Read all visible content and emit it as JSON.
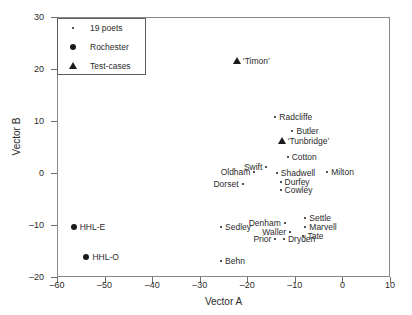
{
  "chart_data": {
    "type": "scatter",
    "title": "",
    "xlabel": "Vector A",
    "ylabel": "Vector B",
    "xlim": [
      -60,
      10
    ],
    "ylim": [
      -20,
      30
    ],
    "xticks": [
      -60,
      -50,
      -40,
      -30,
      -20,
      -10,
      0,
      10
    ],
    "xtick_labels": [
      "–60",
      "–50",
      "–40",
      "–30",
      "–20",
      "–10",
      "0",
      "10"
    ],
    "yticks": [
      -20,
      -10,
      0,
      10,
      20,
      30
    ],
    "ytick_labels": [
      "–20",
      "–10",
      "0",
      "10",
      "20",
      "30"
    ],
    "grid": false,
    "legend_position": "top-left",
    "legend": [
      {
        "label": "19 poets",
        "marker": "small-dot"
      },
      {
        "label": "Rochester",
        "marker": "filled-circle"
      },
      {
        "label": "Test-cases",
        "marker": "filled-triangle"
      }
    ],
    "series": [
      {
        "name": "19 poets",
        "marker": "small-dot",
        "points": [
          {
            "label": "Radcliffe",
            "x": -14.1,
            "y": 10.8,
            "label_side": "right"
          },
          {
            "label": "Butler",
            "x": -10.5,
            "y": 8.0,
            "label_side": "right"
          },
          {
            "label": "Cotton",
            "x": -11.5,
            "y": 3.1,
            "label_side": "right"
          },
          {
            "label": "Swift",
            "x": -16.0,
            "y": 1.2,
            "label_side": "left"
          },
          {
            "label": "Oldham",
            "x": -18.5,
            "y": 0.2,
            "label_side": "left"
          },
          {
            "label": "Shadwell",
            "x": -13.8,
            "y": 0.0,
            "label_side": "right"
          },
          {
            "label": "Milton",
            "x": -3.2,
            "y": 0.2,
            "label_side": "right"
          },
          {
            "label": "Durfey",
            "x": -13.0,
            "y": -1.7,
            "label_side": "right"
          },
          {
            "label": "Dorset",
            "x": -21.0,
            "y": -2.1,
            "label_side": "left"
          },
          {
            "label": "Cowley",
            "x": -13.0,
            "y": -3.3,
            "label_side": "right"
          },
          {
            "label": "Settle",
            "x": -7.8,
            "y": -8.7,
            "label_side": "right"
          },
          {
            "label": "Denham",
            "x": -12.1,
            "y": -9.6,
            "label_side": "left"
          },
          {
            "label": "Sedley",
            "x": -25.5,
            "y": -10.4,
            "label_side": "right"
          },
          {
            "label": "Marvell",
            "x": -7.8,
            "y": -10.4,
            "label_side": "right"
          },
          {
            "label": "Waller",
            "x": -11.0,
            "y": -11.4,
            "label_side": "left"
          },
          {
            "label": "Tate",
            "x": -8.2,
            "y": -12.1,
            "label_side": "right"
          },
          {
            "label": "Prior",
            "x": -14.1,
            "y": -12.7,
            "label_side": "left"
          },
          {
            "label": "Dryden",
            "x": -12.3,
            "y": -12.7,
            "label_side": "right"
          },
          {
            "label": "Behn",
            "x": -25.5,
            "y": -17.0,
            "label_side": "right"
          }
        ]
      },
      {
        "name": "Rochester",
        "marker": "filled-circle",
        "points": [
          {
            "label": "HHL-E",
            "x": -56.5,
            "y": -10.4,
            "label_side": "right"
          },
          {
            "label": "HHL-O",
            "x": -53.8,
            "y": -16.2,
            "label_side": "right"
          }
        ]
      },
      {
        "name": "Test-cases",
        "marker": "filled-triangle",
        "points": [
          {
            "label": "‘Timon’",
            "x": -22.2,
            "y": 21.5,
            "label_side": "right"
          },
          {
            "label": "‘Tunbridge’",
            "x": -12.8,
            "y": 6.2,
            "label_side": "right"
          }
        ]
      }
    ]
  },
  "colors": {
    "marker": "#1a1a1a",
    "axis": "#8a8a8a",
    "text": "#2b2b2b",
    "background": "#ffffff"
  }
}
